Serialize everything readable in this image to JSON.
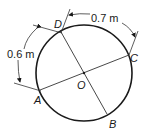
{
  "diagram": {
    "type": "circle-with-diameters",
    "center": {
      "label": "O"
    },
    "points": [
      {
        "id": "A",
        "label": "A"
      },
      {
        "id": "B",
        "label": "B"
      },
      {
        "id": "C",
        "label": "C"
      },
      {
        "id": "D",
        "label": "D"
      }
    ],
    "diameters": [
      {
        "from": "A",
        "to": "C"
      },
      {
        "from": "D",
        "to": "B"
      }
    ],
    "arc_dimensions": [
      {
        "from": "A",
        "to": "D",
        "label": "0.6 m"
      },
      {
        "from": "D",
        "to": "C",
        "label": "0.7 m"
      }
    ],
    "colors": {
      "stroke": "#1a1a1a",
      "background": "#ffffff"
    }
  }
}
